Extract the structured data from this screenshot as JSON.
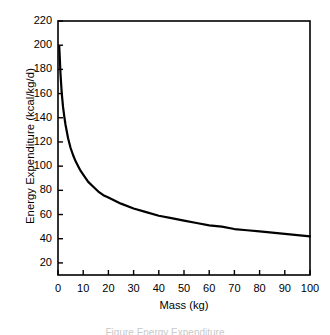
{
  "chart_data": {
    "type": "line",
    "title": "",
    "xlabel": "Mass (kg)",
    "ylabel": "Energy Expenditure (kcal/kg/d)",
    "xlim": [
      0,
      100
    ],
    "ylim": [
      10,
      220
    ],
    "grid": false,
    "legend": null,
    "xticks": [
      0,
      10,
      20,
      30,
      40,
      50,
      60,
      70,
      80,
      90,
      100
    ],
    "xtick_labels": [
      "0",
      "10",
      "20",
      "30",
      "40",
      "50",
      "60",
      "70",
      "80",
      "90",
      "100"
    ],
    "yticks": [
      20,
      40,
      60,
      80,
      100,
      120,
      140,
      160,
      180,
      200,
      220
    ],
    "ytick_labels": [
      "20",
      "40",
      "60",
      "80",
      "100",
      "120",
      "140",
      "160",
      "180",
      "200",
      "220"
    ],
    "line_color": "#000000",
    "line_width": 2.2,
    "series": [
      {
        "name": "mass-specific energy expenditure",
        "x": [
          0.5,
          1,
          1.5,
          2,
          2.5,
          3,
          4,
          5,
          6,
          7,
          8,
          9,
          10,
          12,
          14,
          16,
          18,
          20,
          25,
          30,
          35,
          40,
          45,
          50,
          55,
          60,
          65,
          70,
          75,
          80,
          85,
          90,
          95,
          100
        ],
        "values": [
          199,
          176,
          160,
          149,
          141,
          134,
          123,
          115,
          109,
          104,
          100,
          96,
          93,
          87,
          83,
          79,
          76,
          74,
          69,
          65,
          62,
          59,
          57,
          55,
          53,
          51,
          50,
          48,
          47,
          46,
          45,
          44,
          43,
          42
        ]
      }
    ]
  },
  "axes": {
    "frame_color": "#000000",
    "background": "#ffffff"
  },
  "caption": {
    "clipped_text": "Figure Energy Expenditure"
  }
}
